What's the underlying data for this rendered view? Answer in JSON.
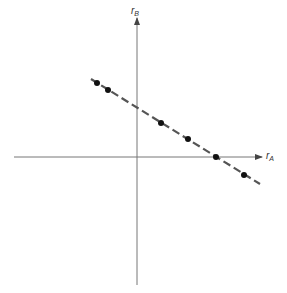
{
  "diagram": {
    "axes": {
      "x_label": "r",
      "x_label_sub": "A",
      "y_label": "r",
      "y_label_sub": "B"
    },
    "line_style": "dashed",
    "points": [
      {
        "x": 97,
        "y": 83
      },
      {
        "x": 108,
        "y": 90
      },
      {
        "x": 161,
        "y": 123
      },
      {
        "x": 188,
        "y": 139
      },
      {
        "x": 216,
        "y": 157
      },
      {
        "x": 244,
        "y": 175
      }
    ],
    "colors": {
      "axis": "#666666",
      "line": "#555555",
      "point": "#111111"
    }
  }
}
